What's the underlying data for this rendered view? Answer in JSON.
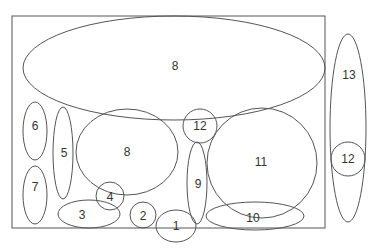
{
  "diagram": {
    "type": "ellipse-packing",
    "colors": {
      "stroke": "#555555",
      "text": "#333333",
      "background": "#ffffff"
    },
    "frame": {
      "x": 12,
      "y": 16,
      "width": 313,
      "height": 212
    },
    "shapes": [
      {
        "id": "e8-top",
        "label": "8",
        "cx": 174,
        "cy": 68,
        "rx": 151,
        "ry": 52
      },
      {
        "id": "e6",
        "label": "6",
        "cx": 35,
        "cy": 131,
        "rx": 12,
        "ry": 29
      },
      {
        "id": "e7",
        "label": "7",
        "cx": 35,
        "cy": 195,
        "rx": 12,
        "ry": 29
      },
      {
        "id": "e5",
        "label": "5",
        "cx": 63,
        "cy": 153,
        "rx": 10,
        "ry": 46
      },
      {
        "id": "e8-mid",
        "label": "8",
        "cx": 127,
        "cy": 152,
        "rx": 51,
        "ry": 43
      },
      {
        "id": "c12-in",
        "label": "12",
        "cx": 200,
        "cy": 126,
        "rx": 17,
        "ry": 17
      },
      {
        "id": "e9",
        "label": "9",
        "cx": 197,
        "cy": 183,
        "rx": 10,
        "ry": 41
      },
      {
        "id": "c11",
        "label": "11",
        "cx": 262,
        "cy": 163,
        "rx": 55,
        "ry": 55
      },
      {
        "id": "e10",
        "label": "10",
        "cx": 255,
        "cy": 216,
        "rx": 49,
        "ry": 14
      },
      {
        "id": "c4",
        "label": "4",
        "cx": 110,
        "cy": 196,
        "rx": 14,
        "ry": 14
      },
      {
        "id": "e3",
        "label": "3",
        "cx": 89,
        "cy": 214,
        "rx": 31,
        "ry": 14
      },
      {
        "id": "c2",
        "label": "2",
        "cx": 143,
        "cy": 215,
        "rx": 13,
        "ry": 13
      },
      {
        "id": "e1",
        "label": "1",
        "cx": 176,
        "cy": 226,
        "rx": 20,
        "ry": 16
      },
      {
        "id": "e13",
        "label": "13",
        "cx": 348,
        "cy": 128,
        "rx": 18,
        "ry": 94
      },
      {
        "id": "c12-out",
        "label": "12",
        "cx": 348,
        "cy": 159,
        "rx": 17,
        "ry": 17
      }
    ],
    "labels": [
      {
        "for": "e8-top",
        "text": "8",
        "x": 175,
        "y": 66
      },
      {
        "for": "e6",
        "text": "6",
        "x": 35,
        "y": 126
      },
      {
        "for": "e7",
        "text": "7",
        "x": 35,
        "y": 187
      },
      {
        "for": "e5",
        "text": "5",
        "x": 64,
        "y": 153
      },
      {
        "for": "e8-mid",
        "text": "8",
        "x": 127,
        "y": 152
      },
      {
        "for": "c12-in",
        "text": "12",
        "x": 200,
        "y": 126
      },
      {
        "for": "e9",
        "text": "9",
        "x": 198,
        "y": 184
      },
      {
        "for": "c11",
        "text": "11",
        "x": 261,
        "y": 162
      },
      {
        "for": "e10",
        "text": "10",
        "x": 253,
        "y": 218
      },
      {
        "for": "c4",
        "text": "4",
        "x": 110,
        "y": 197
      },
      {
        "for": "e3",
        "text": "3",
        "x": 82,
        "y": 215
      },
      {
        "for": "c2",
        "text": "2",
        "x": 143,
        "y": 216
      },
      {
        "for": "e1",
        "text": "1",
        "x": 176,
        "y": 226
      },
      {
        "for": "e13",
        "text": "13",
        "x": 349,
        "y": 75
      },
      {
        "for": "c12-out",
        "text": "12",
        "x": 348,
        "y": 159
      }
    ]
  }
}
